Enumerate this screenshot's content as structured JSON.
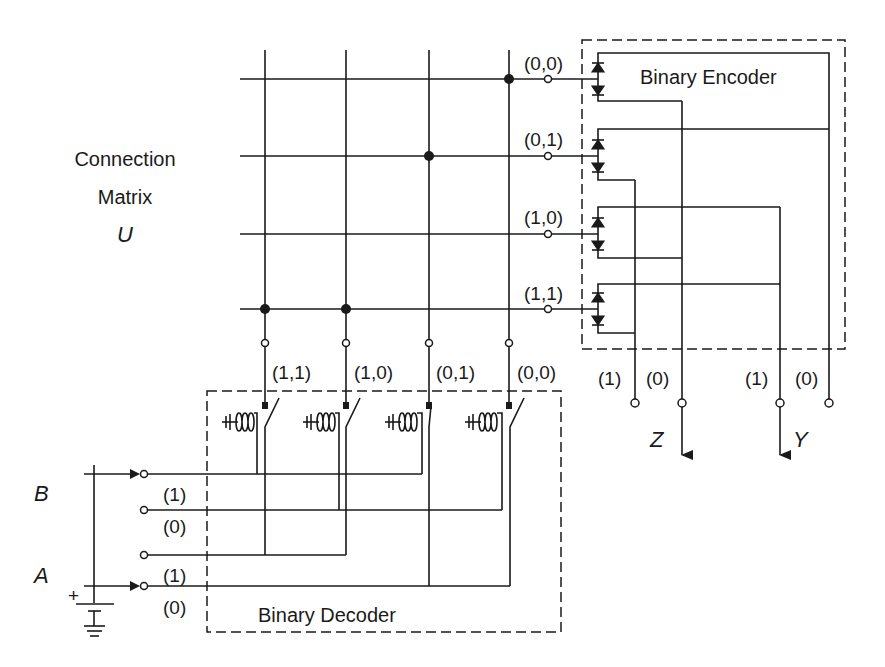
{
  "diagram": {
    "title_matrix": [
      "Connection",
      "Matrix",
      "U"
    ],
    "encoder_label": "Binary Encoder",
    "decoder_label": "Binary Decoder",
    "matrix": {
      "row_labels": [
        "(0,0)",
        "(0,1)",
        "(1,0)",
        "(1,1)"
      ],
      "column_labels": [
        "(1,1)",
        "(1,0)",
        "(0,1)",
        "(0,0)"
      ],
      "connections": [
        {
          "row": "(0,0)",
          "column": "(0,0)"
        },
        {
          "row": "(0,1)",
          "column": "(0,1)"
        },
        {
          "row": "(1,1)",
          "column": "(1,1)"
        },
        {
          "row": "(1,1)",
          "column": "(1,0)"
        }
      ]
    },
    "outputs": {
      "Z": {
        "label": "Z",
        "terminals": [
          "(1)",
          "(0)"
        ]
      },
      "Y": {
        "label": "Y",
        "terminals": [
          "(1)",
          "(0)"
        ]
      }
    },
    "inputs": {
      "B": {
        "label": "B",
        "terminals": [
          "(1)",
          "(0)"
        ]
      },
      "A": {
        "label": "A",
        "terminals": [
          "(1)",
          "(0)"
        ]
      }
    },
    "battery": {
      "polarity_label": "+"
    },
    "relays": [
      {
        "column": "(1,1)",
        "switch": "open"
      },
      {
        "column": "(1,0)",
        "switch": "open"
      },
      {
        "column": "(0,1)",
        "switch": "closed"
      },
      {
        "column": "(0,0)",
        "switch": "open"
      }
    ]
  }
}
